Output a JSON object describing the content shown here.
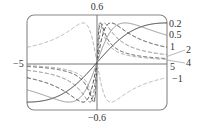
{
  "chart_data": {
    "type": "line",
    "title": "",
    "xlabel": "",
    "ylabel": "",
    "function": "f(x) = c*x / (1 + c^2 * x^2)",
    "xlim": [
      -5,
      5
    ],
    "ylim": [
      -0.6,
      0.6
    ],
    "grid": false,
    "legend_position": "right-edge labels",
    "tick_labels": {
      "y_top": "0.6",
      "y_bottom": "-0.6",
      "x_left": "-5"
    },
    "series": [
      {
        "name": "0.2",
        "c": 0.2,
        "style": "solid",
        "color": "#222222",
        "value_at_x5": 0.5
      },
      {
        "name": "0.5",
        "c": 0.5,
        "style": "solid",
        "color": "#888888",
        "value_at_x5": 0.345
      },
      {
        "name": "1",
        "c": 1,
        "style": "dashed",
        "color": "#333333",
        "value_at_x5": 0.192
      },
      {
        "name": "2",
        "c": 2,
        "style": "dashed",
        "color": "#777777",
        "value_at_x5": 0.099
      },
      {
        "name": "4",
        "c": 4,
        "style": "dashed",
        "color": "#444444",
        "value_at_x5": 0.05
      },
      {
        "name": "5",
        "c": 5,
        "style": "dashed",
        "color": "#999999",
        "value_at_x5": 0.04
      },
      {
        "name": "-1",
        "c": -1,
        "style": "dashed",
        "color": "#aaaaaa",
        "value_at_x5": -0.192
      }
    ]
  },
  "labels": {
    "y_top": "0.6",
    "y_bottom": "−0.6",
    "x_left": "−5",
    "series": [
      "0.2",
      "0.5",
      "1",
      "2",
      "4",
      "5",
      "−1"
    ]
  }
}
